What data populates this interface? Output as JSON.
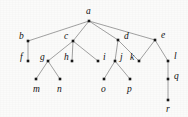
{
  "figure": {
    "name": "rooted-tree-diagram",
    "type": "node-link-tree",
    "background_color": "#fbfbfa",
    "node_color": "#1a1a1a",
    "edge_color": "#8a8a8a",
    "label_color": "#111111",
    "width": 188,
    "height": 117
  },
  "nodes": [
    {
      "id": "a",
      "label": "a",
      "x": 89,
      "y": 21,
      "label_x": 86,
      "label_y": 12,
      "level": 0
    },
    {
      "id": "b",
      "label": "b",
      "x": 28,
      "y": 41,
      "label_x": 19,
      "label_y": 37,
      "level": 1
    },
    {
      "id": "c",
      "label": "c",
      "x": 73,
      "y": 41,
      "label_x": 64,
      "label_y": 37,
      "level": 1
    },
    {
      "id": "d",
      "label": "d",
      "x": 118,
      "y": 40,
      "label_x": 124,
      "label_y": 37,
      "level": 1
    },
    {
      "id": "e",
      "label": "e",
      "x": 155,
      "y": 40,
      "label_x": 161,
      "label_y": 36,
      "level": 1
    },
    {
      "id": "f",
      "label": "f",
      "x": 28,
      "y": 61,
      "label_x": 20,
      "label_y": 58,
      "level": 2
    },
    {
      "id": "g",
      "label": "g",
      "x": 48,
      "y": 61,
      "label_x": 40,
      "label_y": 58,
      "level": 2
    },
    {
      "id": "h",
      "label": "h",
      "x": 72,
      "y": 61,
      "label_x": 64,
      "label_y": 58,
      "level": 2
    },
    {
      "id": "i",
      "label": "i",
      "x": 98,
      "y": 61,
      "label_x": 103,
      "label_y": 58,
      "level": 2
    },
    {
      "id": "j",
      "label": "j",
      "x": 115,
      "y": 61,
      "label_x": 120,
      "label_y": 58,
      "level": 2
    },
    {
      "id": "k",
      "label": "k",
      "x": 139,
      "y": 61,
      "label_x": 130,
      "label_y": 58,
      "level": 2
    },
    {
      "id": "l",
      "label": "l",
      "x": 168,
      "y": 61,
      "label_x": 174,
      "label_y": 57,
      "level": 2
    },
    {
      "id": "m",
      "label": "m",
      "x": 36,
      "y": 79,
      "label_x": 33,
      "label_y": 90,
      "level": 3
    },
    {
      "id": "n",
      "label": "n",
      "x": 60,
      "y": 79,
      "label_x": 57,
      "label_y": 90,
      "level": 3
    },
    {
      "id": "o",
      "label": "o",
      "x": 104,
      "y": 79,
      "label_x": 101,
      "label_y": 90,
      "level": 3
    },
    {
      "id": "p",
      "label": "p",
      "x": 130,
      "y": 79,
      "label_x": 127,
      "label_y": 90,
      "level": 3
    },
    {
      "id": "q",
      "label": "q",
      "x": 168,
      "y": 79,
      "label_x": 174,
      "label_y": 77,
      "level": 3
    },
    {
      "id": "r",
      "label": "r",
      "x": 168,
      "y": 100,
      "label_x": 166,
      "label_y": 110,
      "level": 4
    }
  ],
  "edges": [
    {
      "from": "a",
      "to": "b"
    },
    {
      "from": "a",
      "to": "c"
    },
    {
      "from": "a",
      "to": "d"
    },
    {
      "from": "a",
      "to": "e"
    },
    {
      "from": "b",
      "to": "f"
    },
    {
      "from": "c",
      "to": "g"
    },
    {
      "from": "c",
      "to": "h"
    },
    {
      "from": "c",
      "to": "i"
    },
    {
      "from": "d",
      "to": "j"
    },
    {
      "from": "d",
      "to": "k"
    },
    {
      "from": "e",
      "to": "k"
    },
    {
      "from": "e",
      "to": "l"
    },
    {
      "from": "g",
      "to": "m"
    },
    {
      "from": "g",
      "to": "n"
    },
    {
      "from": "j",
      "to": "o"
    },
    {
      "from": "j",
      "to": "p"
    },
    {
      "from": "l",
      "to": "q"
    },
    {
      "from": "q",
      "to": "r"
    }
  ]
}
